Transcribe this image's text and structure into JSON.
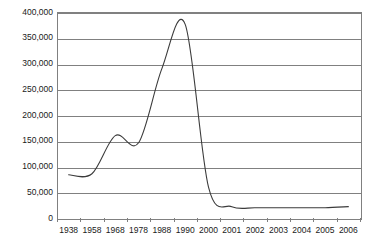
{
  "chart_data": {
    "type": "line",
    "title": "",
    "subtitle": "",
    "xlabel": "",
    "ylabel": "",
    "categories": [
      "1938",
      "1958",
      "1968",
      "1978",
      "1988",
      "1990",
      "2000",
      "2001",
      "2002",
      "2003",
      "2004",
      "2005",
      "2006"
    ],
    "series": [
      {
        "name": "",
        "values": [
          84000,
          86000,
          160000,
          146000,
          290000,
          376000,
          60000,
          22000,
          20000,
          20000,
          20000,
          20000,
          22000
        ]
      }
    ],
    "ylim": [
      0,
      400000
    ],
    "ytick_labels": [
      "0",
      "50,000",
      "100,000",
      "150,000",
      "200,000",
      "250,000",
      "300,000",
      "350,000",
      "400,000"
    ],
    "ytick_values": [
      0,
      50000,
      100000,
      150000,
      200000,
      250000,
      300000,
      350000,
      400000
    ],
    "grid": true,
    "grid_axis": "y",
    "legend": false,
    "legend_position": "none",
    "line_color": "#3b3b3b",
    "grid_color": "#808080",
    "axis_color": "#808080",
    "background_color": "#ffffff",
    "annotations": []
  }
}
